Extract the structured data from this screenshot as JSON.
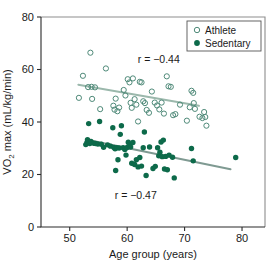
{
  "chart_data": {
    "type": "scatter",
    "title": "",
    "xlabel": "Age group (years)",
    "ylabel": "VO2 max (mL/kg/min)",
    "ylabel_main": "VO",
    "ylabel_sub": "2",
    "ylabel_rest": " max (mL/kg/min)",
    "xlim": [
      45,
      84
    ],
    "ylim": [
      0,
      80
    ],
    "xticks": [
      50,
      60,
      70,
      80
    ],
    "yticks": [
      0,
      20,
      40,
      60,
      80
    ],
    "xtick_labels": [
      "50",
      "60",
      "70",
      "80"
    ],
    "ytick_labels": [
      "0",
      "20",
      "40",
      "60",
      "80"
    ],
    "grid": false,
    "legend_position": "top-right",
    "legend": [
      {
        "name": "Athlete",
        "marker": "open-circle",
        "color": "#4f8a79"
      },
      {
        "name": "Sedentary",
        "marker": "filled-circle",
        "color": "#0d6a4a"
      }
    ],
    "annotations": [
      {
        "text": "r = −0.44",
        "x": 65.5,
        "y": 62.5,
        "series": "Athlete"
      },
      {
        "text": "r = −0.47",
        "x": 61.5,
        "y": 10.5,
        "series": "Sedentary"
      }
    ],
    "series": [
      {
        "name": "Athlete",
        "marker": "open-circle",
        "color": "#4f8a79",
        "r": -0.44,
        "trendline": {
          "x": [
            51.5,
            72.5
          ],
          "y": [
            54.2,
            46.2
          ],
          "color": "#9bb8ac"
        },
        "points": [
          [
            51.6,
            49.2
          ],
          [
            52.3,
            57.6
          ],
          [
            53.2,
            53.3
          ],
          [
            53.6,
            66.4
          ],
          [
            53.8,
            53.4
          ],
          [
            53.9,
            48.8
          ],
          [
            54.4,
            53.2
          ],
          [
            55.3,
            44.9
          ],
          [
            56.3,
            60.4
          ],
          [
            57.6,
            46.2
          ],
          [
            57.8,
            44.7
          ],
          [
            58.0,
            48.9
          ],
          [
            58.3,
            44.1
          ],
          [
            58.6,
            45.5
          ],
          [
            59.4,
            52.2
          ],
          [
            59.7,
            50.1
          ],
          [
            60.1,
            56.3
          ],
          [
            60.4,
            55.1
          ],
          [
            60.6,
            47.3
          ],
          [
            60.8,
            45.4
          ],
          [
            61.0,
            56.6
          ],
          [
            61.3,
            48.7
          ],
          [
            61.6,
            46.6
          ],
          [
            61.9,
            40.2
          ],
          [
            62.2,
            55.3
          ],
          [
            62.5,
            55.1
          ],
          [
            62.8,
            47.9
          ],
          [
            63.1,
            47.2
          ],
          [
            63.4,
            44.6
          ],
          [
            63.8,
            43.5
          ],
          [
            64.3,
            51.6
          ],
          [
            64.8,
            47.4
          ],
          [
            65.2,
            46.3
          ],
          [
            65.6,
            44.8
          ],
          [
            66.0,
            47.4
          ],
          [
            66.4,
            43.2
          ],
          [
            66.9,
            57.4
          ],
          [
            67.2,
            53.6
          ],
          [
            67.6,
            53.4
          ],
          [
            68.0,
            42.6
          ],
          [
            68.4,
            43.0
          ],
          [
            69.2,
            46.6
          ],
          [
            70.4,
            40.5
          ],
          [
            70.9,
            45.6
          ],
          [
            71.2,
            51.9
          ],
          [
            71.5,
            51.1
          ],
          [
            71.6,
            47.2
          ],
          [
            71.8,
            45.0
          ],
          [
            72.6,
            42.0
          ],
          [
            73.1,
            41.5
          ],
          [
            73.4,
            43.8
          ],
          [
            73.6,
            41.9
          ],
          [
            73.8,
            38.6
          ]
        ]
      },
      {
        "name": "Sedentary",
        "marker": "filled-circle",
        "color": "#0d6a4a",
        "r": -0.47,
        "trendline": {
          "x": [
            53.0,
            78.0
          ],
          "y": [
            33.2,
            22.0
          ],
          "color": "#7f9a92"
        },
        "points": [
          [
            52.8,
            31.4
          ],
          [
            53.0,
            32.2
          ],
          [
            53.1,
            33.3
          ],
          [
            53.3,
            39.4
          ],
          [
            53.5,
            31.8
          ],
          [
            53.7,
            32.6
          ],
          [
            54.2,
            31.9
          ],
          [
            54.5,
            31.8
          ],
          [
            54.9,
            31.6
          ],
          [
            55.2,
            40.2
          ],
          [
            55.5,
            31.5
          ],
          [
            55.9,
            30.4
          ],
          [
            56.6,
            31.3
          ],
          [
            57.1,
            30.8
          ],
          [
            57.5,
            37.8
          ],
          [
            57.7,
            30.3
          ],
          [
            57.9,
            29.8
          ],
          [
            58.0,
            21.5
          ],
          [
            58.2,
            30.2
          ],
          [
            58.4,
            25.6
          ],
          [
            58.6,
            30.1
          ],
          [
            58.8,
            35.3
          ],
          [
            59.0,
            38.6
          ],
          [
            59.3,
            30.2
          ],
          [
            59.6,
            29.5
          ],
          [
            59.8,
            27.4
          ],
          [
            60.0,
            30.3
          ],
          [
            60.2,
            32.3
          ],
          [
            60.4,
            31.4
          ],
          [
            60.6,
            30.5
          ],
          [
            60.8,
            24.3
          ],
          [
            61.0,
            32.2
          ],
          [
            61.3,
            23.8
          ],
          [
            61.6,
            25.6
          ],
          [
            61.9,
            22.9
          ],
          [
            62.2,
            26.5
          ],
          [
            62.5,
            23.2
          ],
          [
            62.8,
            30.2
          ],
          [
            63.0,
            36.2
          ],
          [
            63.3,
            19.6
          ],
          [
            63.9,
            30.5
          ],
          [
            64.5,
            22.3
          ],
          [
            64.9,
            23.1
          ],
          [
            65.3,
            30.2
          ],
          [
            65.5,
            27.1
          ],
          [
            65.7,
            28.5
          ],
          [
            65.9,
            32.4
          ],
          [
            66.1,
            26.8
          ],
          [
            66.3,
            33.1
          ],
          [
            66.5,
            22.1
          ],
          [
            66.7,
            26.9
          ],
          [
            67.0,
            21.8
          ],
          [
            67.3,
            27.4
          ],
          [
            67.9,
            26.6
          ],
          [
            68.2,
            18.7
          ],
          [
            71.2,
            29.9
          ],
          [
            71.5,
            25.2
          ],
          [
            78.9,
            26.5
          ]
        ]
      }
    ]
  }
}
